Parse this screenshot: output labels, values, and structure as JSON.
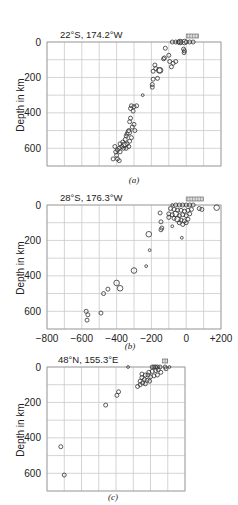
{
  "chart_data": [
    {
      "type": "scatter",
      "panel_caption": "(a)",
      "title": "22°S, 174.2°W",
      "xlabel": "",
      "ylabel": "Depth in km",
      "xlim": [
        -800,
        200
      ],
      "ylim": [
        0,
        700
      ],
      "y_inverted": true,
      "yticks": [
        "0",
        "200",
        "400",
        "600"
      ],
      "ytick_values": [
        0,
        200,
        400,
        600
      ],
      "xticks": [],
      "grid": true,
      "stations_marker_x": [
        0,
        70
      ],
      "points": [
        [
          -80,
          0,
          1
        ],
        [
          -60,
          0,
          1
        ],
        [
          -45,
          0,
          1
        ],
        [
          -35,
          0,
          2
        ],
        [
          -30,
          0,
          1
        ],
        [
          -10,
          0,
          2
        ],
        [
          0,
          0,
          1
        ],
        [
          20,
          0,
          1
        ],
        [
          40,
          0,
          1
        ],
        [
          -15,
          40,
          1
        ],
        [
          -10,
          50,
          1
        ],
        [
          -12,
          60,
          1
        ],
        [
          -60,
          110,
          1
        ],
        [
          -120,
          35,
          1
        ],
        [
          -125,
          90,
          1
        ],
        [
          -100,
          75,
          1
        ],
        [
          -95,
          110,
          1
        ],
        [
          -75,
          120,
          1
        ],
        [
          -130,
          95,
          1
        ],
        [
          -85,
          140,
          1
        ],
        [
          -180,
          130,
          1
        ],
        [
          -175,
          150,
          1
        ],
        [
          -190,
          165,
          1
        ],
        [
          -155,
          160,
          2
        ],
        [
          -150,
          160,
          2
        ],
        [
          -190,
          210,
          1
        ],
        [
          -165,
          205,
          1
        ],
        [
          -195,
          240,
          1
        ],
        [
          -195,
          255,
          1
        ],
        [
          -250,
          300,
          0
        ],
        [
          -315,
          360,
          1
        ],
        [
          -300,
          365,
          1
        ],
        [
          -285,
          360,
          1
        ],
        [
          -320,
          375,
          1
        ],
        [
          -305,
          390,
          1
        ],
        [
          -320,
          430,
          1
        ],
        [
          -325,
          450,
          1
        ],
        [
          -300,
          465,
          1
        ],
        [
          -310,
          480,
          1
        ],
        [
          -295,
          500,
          1
        ],
        [
          -330,
          500,
          1
        ],
        [
          -340,
          520,
          1
        ],
        [
          -330,
          510,
          2
        ],
        [
          -345,
          530,
          1
        ],
        [
          -315,
          540,
          1
        ],
        [
          -325,
          560,
          1
        ],
        [
          -350,
          550,
          1
        ],
        [
          -355,
          580,
          2
        ],
        [
          -340,
          575,
          1
        ],
        [
          -365,
          565,
          1
        ],
        [
          -370,
          590,
          1
        ],
        [
          -380,
          575,
          1
        ],
        [
          -385,
          600,
          1
        ],
        [
          -395,
          610,
          1
        ],
        [
          -405,
          620,
          1
        ],
        [
          -410,
          590,
          1
        ],
        [
          -380,
          620,
          1
        ],
        [
          -400,
          640,
          1
        ],
        [
          -395,
          660,
          1
        ],
        [
          -420,
          660,
          1
        ],
        [
          -385,
          670,
          1
        ],
        [
          -360,
          600,
          1
        ],
        [
          -345,
          600,
          1
        ],
        [
          -330,
          590,
          1
        ]
      ]
    },
    {
      "type": "scatter",
      "panel_caption": "(b)",
      "title": "28°S, 176.3°W",
      "xlabel": "",
      "ylabel": "Depth in km",
      "xlim": [
        -800,
        200
      ],
      "ylim": [
        0,
        700
      ],
      "y_inverted": true,
      "xticks": [
        "−800",
        "−600",
        "−400",
        "−200",
        "0",
        "+200"
      ],
      "xtick_values": [
        -800,
        -600,
        -400,
        -200,
        0,
        200
      ],
      "yticks": [
        "0",
        "200",
        "400",
        "600"
      ],
      "ytick_values": [
        0,
        200,
        400,
        600
      ],
      "grid": true,
      "stations_marker_x": [
        0,
        100
      ],
      "points": [
        [
          -80,
          0,
          0
        ],
        [
          -60,
          0,
          1
        ],
        [
          -40,
          0,
          1
        ],
        [
          -20,
          0,
          1
        ],
        [
          0,
          0,
          1
        ],
        [
          20,
          0,
          1
        ],
        [
          40,
          0,
          1
        ],
        [
          -90,
          20,
          1
        ],
        [
          -70,
          25,
          1
        ],
        [
          -50,
          30,
          1
        ],
        [
          -30,
          30,
          1
        ],
        [
          -10,
          35,
          1
        ],
        [
          10,
          30,
          1
        ],
        [
          30,
          25,
          1
        ],
        [
          -100,
          50,
          1
        ],
        [
          -80,
          55,
          1
        ],
        [
          -60,
          50,
          2
        ],
        [
          -40,
          60,
          1
        ],
        [
          -20,
          55,
          1
        ],
        [
          0,
          60,
          1
        ],
        [
          20,
          50,
          1
        ],
        [
          -100,
          70,
          1
        ],
        [
          -70,
          75,
          1
        ],
        [
          -50,
          80,
          2
        ],
        [
          -30,
          85,
          1
        ],
        [
          -10,
          90,
          1
        ],
        [
          10,
          80,
          1
        ],
        [
          -40,
          100,
          1
        ],
        [
          0,
          100,
          1
        ],
        [
          -20,
          110,
          1
        ],
        [
          75,
          20,
          1
        ],
        [
          90,
          25,
          1
        ],
        [
          175,
          15,
          2
        ],
        [
          -150,
          45,
          1
        ],
        [
          -145,
          95,
          1
        ],
        [
          -145,
          140,
          1
        ],
        [
          -140,
          130,
          1
        ],
        [
          -80,
          120,
          0
        ],
        [
          -25,
          185,
          0
        ],
        [
          -215,
          165,
          2
        ],
        [
          -210,
          255,
          0
        ],
        [
          -230,
          345,
          0
        ],
        [
          -300,
          370,
          2
        ],
        [
          -400,
          440,
          2
        ],
        [
          -380,
          470,
          2
        ],
        [
          -450,
          475,
          1
        ],
        [
          -475,
          500,
          1
        ],
        [
          -490,
          610,
          1
        ],
        [
          -575,
          600,
          1
        ],
        [
          -565,
          620,
          1
        ],
        [
          -570,
          650,
          1
        ]
      ]
    },
    {
      "type": "scatter",
      "panel_caption": "(c)",
      "title": "48°N, 155.3°E",
      "xlabel": "",
      "ylabel": "Depth in km",
      "xlim": [
        -700,
        100
      ],
      "ylim": [
        0,
        700
      ],
      "y_inverted": true,
      "xticks": [],
      "yticks": [
        "0",
        "200",
        "400",
        "600"
      ],
      "ytick_values": [
        0,
        200,
        400,
        600
      ],
      "grid": true,
      "stations_marker_x": [
        -30,
        0
      ],
      "points": [
        [
          -230,
          0,
          0
        ],
        [
          -90,
          0,
          1
        ],
        [
          -80,
          0,
          1
        ],
        [
          -70,
          0,
          1
        ],
        [
          -60,
          0,
          1
        ],
        [
          -45,
          0,
          1
        ],
        [
          -15,
          0,
          1
        ],
        [
          -10,
          10,
          1
        ],
        [
          10,
          0,
          0
        ],
        [
          -55,
          15,
          1
        ],
        [
          -70,
          20,
          1
        ],
        [
          -90,
          25,
          1
        ],
        [
          -110,
          30,
          1
        ],
        [
          -40,
          30,
          1
        ],
        [
          -150,
          40,
          1
        ],
        [
          -130,
          45,
          1
        ],
        [
          -115,
          45,
          1
        ],
        [
          -100,
          55,
          1
        ],
        [
          -80,
          50,
          1
        ],
        [
          -60,
          45,
          1
        ],
        [
          -150,
          60,
          1
        ],
        [
          -135,
          70,
          1
        ],
        [
          -120,
          75,
          1
        ],
        [
          -105,
          80,
          1
        ],
        [
          -160,
          80,
          1
        ],
        [
          -145,
          90,
          1
        ],
        [
          -130,
          95,
          1
        ],
        [
          -160,
          100,
          1
        ],
        [
          -175,
          110,
          1
        ],
        [
          -285,
          140,
          1
        ],
        [
          -295,
          160,
          1
        ],
        [
          -360,
          215,
          1
        ],
        [
          -620,
          450,
          1
        ],
        [
          -600,
          610,
          1
        ]
      ]
    }
  ]
}
